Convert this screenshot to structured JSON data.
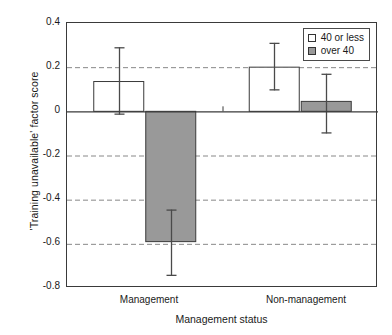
{
  "chart_data": {
    "type": "bar",
    "title": "",
    "xlabel": "Management status",
    "ylabel": "'Training unavailable' factor score",
    "categories": [
      "Management",
      "Non-management"
    ],
    "ylim": [
      -0.8,
      0.4
    ],
    "yticks": [
      "0.4",
      "0.2",
      "0",
      "-0.2",
      "-0.4",
      "-0.6",
      "-0.8"
    ],
    "ytick_values": [
      0.4,
      0.2,
      0,
      -0.2,
      -0.4,
      -0.6,
      -0.8
    ],
    "grid": "horizontal-dashed",
    "legend_position": "top-right",
    "zero_line": true,
    "series": [
      {
        "name": "40 or less",
        "fill": "#ffffff",
        "values": [
          0.135,
          0.2
        ],
        "err_low": [
          -0.015,
          0.095
        ],
        "err_high": [
          0.29,
          0.31
        ]
      },
      {
        "name": "over 40",
        "fill": "#999999",
        "values": [
          -0.59,
          0.045
        ],
        "err_low": [
          -0.745,
          -0.1
        ],
        "err_high": [
          -0.445,
          0.17
        ]
      }
    ]
  },
  "legend": {
    "items": [
      {
        "label": "40 or less",
        "swatch": "#ffffff"
      },
      {
        "label": "over 40",
        "swatch": "#999999"
      }
    ]
  },
  "axes": {
    "y_title": "'Training unavailable' factor score",
    "x_title": "Management status",
    "y_tick_labels": [
      "0.4",
      "0.2",
      "0",
      "-0.2",
      "-0.4",
      "-0.6",
      "-0.8"
    ],
    "x_tick_labels": [
      "Management",
      "Non-management"
    ]
  },
  "colors": {
    "bar_open": "#ffffff",
    "bar_filled": "#999999",
    "axis": "#3a3a3a",
    "grid": "#888888",
    "error": "#4a4a4a",
    "text": "#1a1a1a",
    "background": "#ffffff"
  }
}
